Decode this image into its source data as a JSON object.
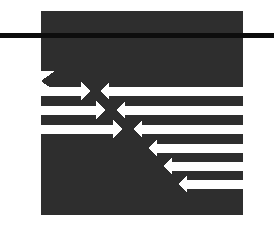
{
  "image": {
    "title": "Arrow Interchange Logo",
    "width": 274,
    "height": 230,
    "background_color": "#ffffff",
    "alt_text": "Dark square mark containing interleaved white arrows pointing left and right, crossed by a horizontal black rule"
  },
  "colors": {
    "background": "#ffffff",
    "plate": "#2e2e2e",
    "arrow": "#ffffff",
    "rule": "#0d0d0d"
  },
  "plate": {
    "name": "dark-plate",
    "x": 41,
    "y": 11,
    "width": 202,
    "height": 204
  },
  "rule": {
    "name": "horizontal-rule",
    "x": 0,
    "y": 33,
    "width": 274,
    "height": 5,
    "label": "horizontal rule"
  },
  "arrows": {
    "right_pointing": [
      {
        "id": "arrow-right-1",
        "y": 91,
        "tail_x": 41,
        "head_x": 90,
        "thickness": 9,
        "head_half": 9,
        "direction": "right"
      },
      {
        "id": "arrow-right-2",
        "y": 110,
        "tail_x": 41,
        "head_x": 105,
        "thickness": 9,
        "head_half": 9,
        "direction": "right"
      },
      {
        "id": "arrow-right-3",
        "y": 129,
        "tail_x": 41,
        "head_x": 122,
        "thickness": 9,
        "head_half": 9,
        "direction": "right"
      }
    ],
    "left_pointing": [
      {
        "id": "arrow-left-1",
        "y": 91,
        "tail_x": 243,
        "head_x": 100,
        "thickness": 9,
        "head_half": 9,
        "direction": "left"
      },
      {
        "id": "arrow-left-2",
        "y": 110,
        "tail_x": 243,
        "head_x": 116,
        "thickness": 9,
        "head_half": 9,
        "direction": "left"
      },
      {
        "id": "arrow-left-3",
        "y": 129,
        "tail_x": 243,
        "head_x": 133,
        "thickness": 9,
        "head_half": 9,
        "direction": "left"
      },
      {
        "id": "arrow-left-4",
        "y": 148,
        "tail_x": 243,
        "head_x": 148,
        "thickness": 9,
        "head_half": 9,
        "direction": "left"
      },
      {
        "id": "arrow-left-5",
        "y": 166,
        "tail_x": 243,
        "head_x": 163,
        "thickness": 9,
        "head_half": 9,
        "direction": "left"
      },
      {
        "id": "arrow-left-6",
        "y": 184,
        "tail_x": 243,
        "head_x": 178,
        "thickness": 9,
        "head_half": 9,
        "direction": "left"
      }
    ],
    "notch": {
      "id": "chevron-notch",
      "x": 41,
      "y": 71,
      "width": 14,
      "height": 20,
      "label": "left edge chevron notch"
    }
  },
  "counts": {
    "right_arrows": 3,
    "left_arrows": 6,
    "total_arrows": 9
  }
}
